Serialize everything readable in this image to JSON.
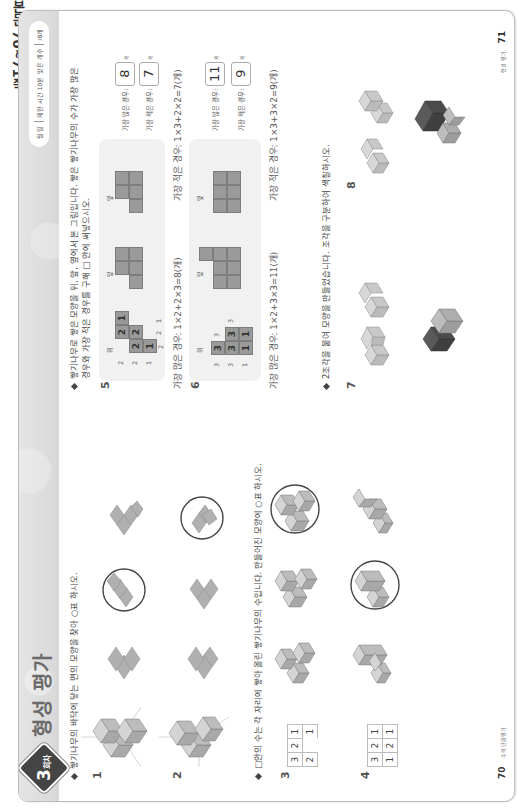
{
  "side_label": "본문 70~71쪽",
  "header": {
    "badge_number": "3",
    "badge_suffix": "회차",
    "title": "형성 평가",
    "time_pill": {
      "date": "월  일",
      "time": "제한 시간 10분",
      "score_label": "맞은 개수",
      "score_total": "/8개"
    }
  },
  "section1": {
    "instruction": "쌓기나무의 바닥에 닿는 면의 모양을 찾아 ○표 하시오.",
    "questions": [
      {
        "number": "1",
        "options": 3,
        "circled_index": 1
      },
      {
        "number": "2",
        "options": 3,
        "circled_index": 2
      }
    ]
  },
  "section2": {
    "instruction": "□안의 수는 각 자리에 쌓아 올린 쌓기나무의 수입니다. 만들어진 모양에 ○표 하시오.",
    "questions": [
      {
        "number": "3",
        "grid": [
          [
            "3",
            "2",
            "1"
          ],
          [
            "2",
            "",
            "1"
          ]
        ],
        "circled_index": 2
      },
      {
        "number": "4",
        "grid": [
          [
            "3",
            "2",
            "1"
          ],
          [
            "1",
            "2",
            "1"
          ]
        ],
        "circled_index": 1
      }
    ]
  },
  "section3": {
    "instruction_line1": "쌓기나무로 쌓은 모양을 위, 앞, 옆에서 본 그림입니다. 쌓은 쌓기나무의 수가 가장 많은",
    "instruction_line2": "경우와 가장 적은 경우를 구해 □ 안에 써넣으시오.",
    "view_labels": {
      "top": "위",
      "front": "앞",
      "side": "옆"
    },
    "questions": [
      {
        "number": "5",
        "top_grid_numbers": [
          "1",
          "2",
          "2",
          "2",
          "1"
        ],
        "front_counts": [
          "1",
          "2",
          "2"
        ],
        "side_counts": [
          "1",
          "2",
          "2"
        ],
        "most_label": "가장 많은 경우:",
        "most_value": "8",
        "least_label": "가장 적은 경우:",
        "least_value": "7",
        "unit": "개",
        "most_explain": "가장 많은 경우: 1×2+2×3=8(개)",
        "least_explain": "가장 적은 경우: 1×3+2×2=7(개)"
      },
      {
        "number": "6",
        "top_grid_numbers": [
          "3",
          "3",
          "3",
          "1",
          "1"
        ],
        "front_counts": [
          "1",
          "3",
          "3"
        ],
        "side_counts": [
          "3",
          "3"
        ],
        "most_label": "가장 많은 경우:",
        "most_value": "11",
        "least_label": "가장 적은 경우:",
        "least_value": "9",
        "unit": "개",
        "most_explain": "가장 많은 경우: 1×2+3×3=11(개)",
        "least_explain": "가장 적은 경우: 1×3+3×2=9(개)"
      }
    ]
  },
  "section4": {
    "instruction": "2조각을 붙여 모양을 만들었습니다. 조각을 구분하여 색칠하시오.",
    "questions": [
      {
        "number": "7"
      },
      {
        "number": "8"
      }
    ]
  },
  "footer": {
    "left_page": "70",
    "left_caption": "수학 단원평가",
    "right_page": "71",
    "right_caption": "형성 평가"
  },
  "colors": {
    "block_light": "#c9c9c9",
    "block_mid": "#a9a9a9",
    "block_dark": "#555555",
    "ring": "#444444",
    "panel": "#f1f1f1"
  }
}
